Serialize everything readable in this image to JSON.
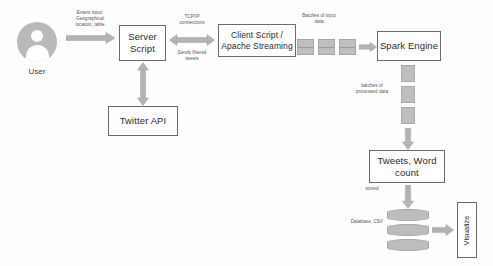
{
  "diagram": {
    "palette": {
      "node_border": "#6b6b6b",
      "node_fill": "#ffffff",
      "arrow_fill": "#b3b3b3",
      "block_fill": "#bfbfbf",
      "cylinder_fill": "#bdbdbd",
      "avatar_fill": "#b9b9b9",
      "note_text": "#555555",
      "node_text": "#2b2b2b",
      "background": "#fefefe"
    },
    "actor": {
      "icon": "user-avatar-icon",
      "caption": "User"
    },
    "nodes": [
      {
        "id": "server-script",
        "label": "Server\nScript"
      },
      {
        "id": "twitter-api",
        "label": "Twitter API"
      },
      {
        "id": "client-script",
        "label": "Client Script /\nApache Streaming"
      },
      {
        "id": "spark-engine",
        "label": "Spark Engine"
      },
      {
        "id": "tweets-word-count",
        "label": "Tweets, Word\ncount"
      },
      {
        "id": "visualize",
        "label": "Visualize"
      }
    ],
    "edge_labels": {
      "user_to_server": "Enters input:\nGeographical\nlocation, table",
      "tcp_connections": "TCP/IP\nconnections",
      "sends_filtered_tweets": "Sends filtered\ntweets",
      "batches_of_input_data": "Batches of input\ndata",
      "batches_of_processed_data": "batches of\nprocessed data",
      "stored": "stored",
      "database_csv": "Database, CSV"
    },
    "groups": {
      "input_batches": {
        "name": "input-batch-blocks",
        "count": 3
      },
      "processed_batches": {
        "name": "processed-batch-blocks",
        "count": 3
      },
      "database_stack": {
        "name": "database-cylinders",
        "count": 3
      }
    }
  }
}
